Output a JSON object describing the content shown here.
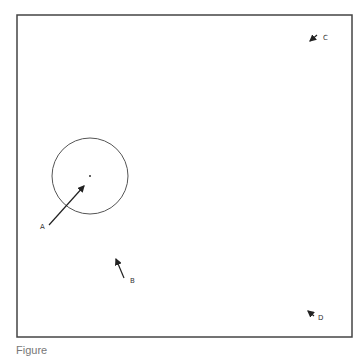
{
  "figure": {
    "frame": {
      "x": 17,
      "y": 15,
      "width": 335,
      "height": 322,
      "stroke": "#444444"
    },
    "circle": {
      "cx": 90,
      "cy": 176,
      "r": 38,
      "center_dot": true
    },
    "markers": [
      {
        "label": "A",
        "label_x": 40,
        "label_y": 229,
        "x1": 49,
        "y1": 225,
        "x2": 84,
        "y2": 186
      },
      {
        "label": "B",
        "label_x": 130,
        "label_y": 283,
        "x1": 124,
        "y1": 278,
        "x2": 116,
        "y2": 259
      },
      {
        "label": "C",
        "label_x": 323,
        "label_y": 40,
        "x1": 317,
        "y1": 35,
        "x2": 310,
        "y2": 41
      },
      {
        "label": "D",
        "label_x": 318,
        "label_y": 320,
        "x1": 314,
        "y1": 316,
        "x2": 308,
        "y2": 311
      }
    ]
  },
  "caption": {
    "text": "Figure"
  }
}
